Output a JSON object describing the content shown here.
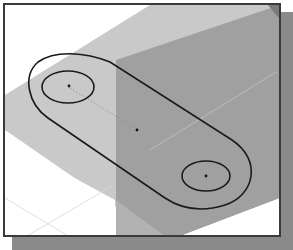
{
  "figure": {
    "colors": {
      "background": "#ffffff",
      "plane_light": "#c8c8c8",
      "plane_dark": "#9c9c9c",
      "plane_mid": "#b4b4b4",
      "outline": "#1a1a1a",
      "frame_border": "#3a3a3a",
      "shadow": "#8a8a8a",
      "grid_line": "#d8d8d8"
    },
    "sketch": {
      "left_hole_center": [
        68,
        86
      ],
      "right_hole_center": [
        206,
        176
      ],
      "mid_point": [
        137,
        130
      ],
      "hole_rx": 26,
      "hole_ry": 16
    }
  }
}
